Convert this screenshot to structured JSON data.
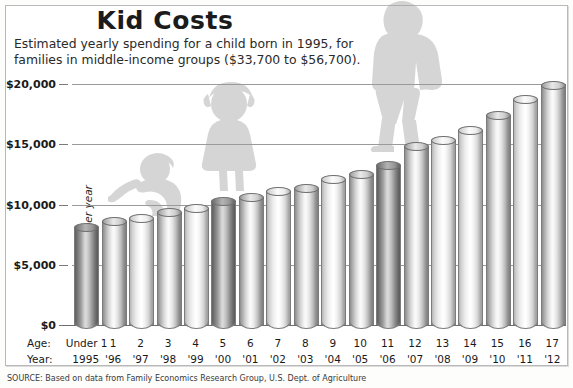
{
  "header": {
    "title": "Kid Costs",
    "subtitle_line1": "Estimated yearly spending for a child born in 1995, for",
    "subtitle_line2": "families in middle-income groups ($33,700 to $56,700)."
  },
  "axis": {
    "y_title": "Cost per year",
    "age_row_label": "Age:",
    "year_row_label": "Year:"
  },
  "source": "SOURCE: Based on data from Family Economics Research Group, U.S. Dept. of Agriculture",
  "colors": {
    "frame": "#b9b9b9",
    "gridline": "#9a9a9a",
    "baseline": "#6e6e6e",
    "text": "#1b1b1b",
    "silhouette": "#9d9d9d"
  },
  "chart_data": {
    "type": "bar",
    "title": "Kid Costs",
    "subtitle": "Estimated yearly spending for a child born in 1995, for families in middle-income groups ($33,700 to $56,700).",
    "xlabel": "Age / Year",
    "ylabel": "Cost per year",
    "ylim": [
      0,
      22000
    ],
    "grid": true,
    "legend": "none",
    "ytick_labels": [
      "$0",
      "$5,000",
      "$10,000",
      "$15,000",
      "$20,000"
    ],
    "ytick_values": [
      0,
      5000,
      10000,
      15000,
      20000
    ],
    "categories": [
      "Under 1",
      "1",
      "2",
      "3",
      "4",
      "5",
      "6",
      "7",
      "8",
      "9",
      "10",
      "11",
      "12",
      "13",
      "14",
      "15",
      "16",
      "17"
    ],
    "years": [
      "1995",
      "'96",
      "'97",
      "'98",
      "'99",
      "'00",
      "'01",
      "'02",
      "'03",
      "'04",
      "'05",
      "'06",
      "'07",
      "'08",
      "'09",
      "'10",
      "'11",
      "'12"
    ],
    "values": [
      8100,
      8600,
      8900,
      9400,
      9700,
      10300,
      10600,
      11100,
      11400,
      12100,
      12500,
      13300,
      14900,
      15400,
      16200,
      17400,
      18800,
      19900
    ],
    "bar_shades": [
      "dark",
      "mid",
      "light",
      "mid",
      "light",
      "dark",
      "mid",
      "light",
      "mid",
      "light",
      "mid",
      "dark",
      "mid",
      "light",
      "light",
      "mid",
      "light",
      "mid"
    ],
    "annotations": [
      {
        "name": "crawling-baby-silhouette",
        "near_category": "1"
      },
      {
        "name": "toddler-girl-silhouette",
        "near_category": "5"
      },
      {
        "name": "teenager-backpack-silhouette",
        "near_category": "12"
      }
    ]
  }
}
